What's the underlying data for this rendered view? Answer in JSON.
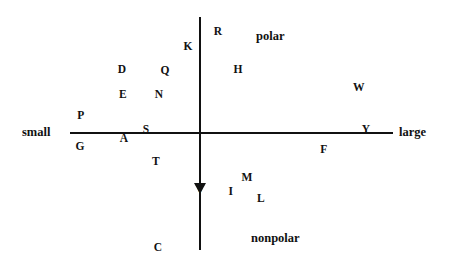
{
  "chart_data": {
    "type": "scatter",
    "title": "",
    "subtitle": "",
    "xlabel": "",
    "ylabel": "",
    "xlim": [
      -1,
      1
    ],
    "ylim": [
      -1,
      1
    ],
    "grid": false,
    "legend": null,
    "axis_endpoint_labels": {
      "x_left": "small",
      "x_right": "large",
      "y_top": "polar",
      "y_bottom": "nonpolar"
    },
    "annotations": [
      {
        "text": "small",
        "role": "x-axis-left-end"
      },
      {
        "text": "large",
        "role": "x-axis-right-end"
      },
      {
        "text": "polar",
        "role": "y-axis-top-quadrant"
      },
      {
        "text": "nonpolar",
        "role": "y-axis-bottom-quadrant"
      }
    ],
    "point_labels": [
      "R",
      "K",
      "H",
      "D",
      "E",
      "Q",
      "N",
      "W",
      "P",
      "S",
      "A",
      "G",
      "Y",
      "F",
      "T",
      "V",
      "M",
      "I",
      "L",
      "C"
    ],
    "points": [
      {
        "label": "R",
        "px": 218,
        "py": 32
      },
      {
        "label": "K",
        "px": 188,
        "py": 47
      },
      {
        "label": "H",
        "px": 238,
        "py": 70
      },
      {
        "label": "D",
        "px": 122,
        "py": 70
      },
      {
        "label": "Q",
        "px": 165,
        "py": 71
      },
      {
        "label": "E",
        "px": 123,
        "py": 95
      },
      {
        "label": "N",
        "px": 159,
        "py": 95
      },
      {
        "label": "W",
        "px": 359,
        "py": 88
      },
      {
        "label": "P",
        "px": 81,
        "py": 116
      },
      {
        "label": "S",
        "px": 146,
        "py": 130
      },
      {
        "label": "Y",
        "px": 366,
        "py": 130
      },
      {
        "label": "A",
        "px": 124,
        "py": 139
      },
      {
        "label": "G",
        "px": 80,
        "py": 147
      },
      {
        "label": "F",
        "px": 324,
        "py": 150
      },
      {
        "label": "T",
        "px": 156,
        "py": 162
      },
      {
        "label": "M",
        "px": 247,
        "py": 178
      },
      {
        "label": "V",
        "px": 200,
        "py": 190
      },
      {
        "label": "I",
        "px": 231,
        "py": 192
      },
      {
        "label": "L",
        "px": 261,
        "py": 199
      },
      {
        "label": "C",
        "px": 158,
        "py": 248
      }
    ]
  },
  "axes": {
    "x_axis": {
      "name": "size-axis",
      "left_label": "small",
      "right_label": "large"
    },
    "y_axis": {
      "name": "polarity-axis",
      "top_label": "polar",
      "bottom_label": "nonpolar"
    }
  },
  "labels": {
    "small": "small",
    "large": "large",
    "polar": "polar",
    "nonpolar": "nonpolar"
  },
  "colors": {
    "ink": "#111111",
    "background": "#ffffff"
  }
}
